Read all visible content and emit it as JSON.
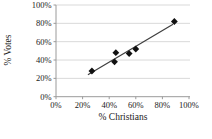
{
  "chart_data": {
    "type": "scatter",
    "title": "",
    "xlabel": "% Christians",
    "ylabel": "% Votes",
    "xlim": [
      0,
      100
    ],
    "ylim": [
      0,
      100
    ],
    "grid": "horizontal",
    "legend": "none",
    "marker": "diamond",
    "x_ticks": {
      "values": [
        0,
        20,
        40,
        60,
        80,
        100
      ],
      "labels": [
        "0%",
        "20%",
        "40%",
        "60%",
        "80%",
        "100%"
      ]
    },
    "y_ticks": {
      "values": [
        0,
        20,
        40,
        60,
        80,
        100
      ],
      "labels": [
        "0%",
        "20%",
        "40%",
        "60%",
        "80%",
        "100%"
      ]
    },
    "points": [
      {
        "x": 27,
        "y": 28
      },
      {
        "x": 44,
        "y": 38
      },
      {
        "x": 45,
        "y": 48
      },
      {
        "x": 55,
        "y": 47
      },
      {
        "x": 60,
        "y": 52
      },
      {
        "x": 89,
        "y": 82
      }
    ],
    "trendline": {
      "x1": 24,
      "y1": 24,
      "x2": 88,
      "y2": 79
    },
    "colors": {
      "marker": "#111111",
      "trendline": "#3f3f3f",
      "gridline": "#d9d9d9",
      "axis": "#9a9a9a",
      "text": "#1a1a1a",
      "background": "#ffffff"
    }
  }
}
